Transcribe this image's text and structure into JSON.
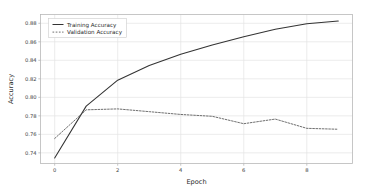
{
  "chart_data": {
    "type": "line",
    "title": "",
    "xlabel": "Epoch",
    "ylabel": "Accuracy",
    "xlim": [
      -0.45,
      9.45
    ],
    "ylim": [
      0.7285,
      0.8895
    ],
    "xticks": [
      0,
      2,
      4,
      6,
      8
    ],
    "xtick_labels": [
      "0",
      "2",
      "4",
      "6",
      "8"
    ],
    "yticks": [
      0.74,
      0.76,
      0.78,
      0.8,
      0.82,
      0.84,
      0.86,
      0.88
    ],
    "ytick_labels": [
      "0.74",
      "0.76",
      "0.78",
      "0.80",
      "0.82",
      "0.84",
      "0.86",
      "0.88"
    ],
    "grid": true,
    "legend_position": "upper left",
    "x": [
      0,
      1,
      2,
      3,
      4,
      5,
      6,
      7,
      8,
      9
    ],
    "series": [
      {
        "name": "Training Accuracy",
        "style": "solid",
        "color": "#333333",
        "values": [
          0.7345,
          0.7905,
          0.8185,
          0.8345,
          0.8465,
          0.8565,
          0.8655,
          0.8735,
          0.8795,
          0.8825
        ]
      },
      {
        "name": "Validation Accuracy",
        "style": "dashed",
        "color": "#555555",
        "values": [
          0.7555,
          0.7865,
          0.7875,
          0.7845,
          0.7815,
          0.7795,
          0.7715,
          0.7765,
          0.7665,
          0.7655
        ]
      }
    ]
  },
  "legend": {
    "entries": [
      {
        "label": "Training Accuracy",
        "style": "solid"
      },
      {
        "label": "Validation Accuracy",
        "style": "dashed"
      }
    ]
  },
  "colors": {
    "training": "#333333",
    "validation": "#555555",
    "grid": "#e4e4e4",
    "axis": "#b8b8b8",
    "text": "#2b2b2b"
  }
}
